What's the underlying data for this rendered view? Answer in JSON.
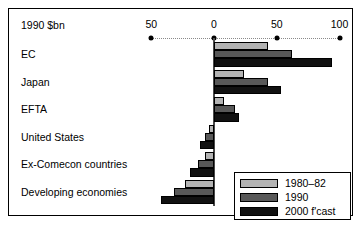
{
  "chart_data": {
    "type": "bar",
    "orientation": "horizontal",
    "title": "",
    "unit_label": "1990 $bn",
    "xlabel": "",
    "ylabel": "",
    "xlim": [
      -60,
      105
    ],
    "grid": false,
    "legend_position": "bottom-right",
    "axis_ticks": [
      {
        "label": "50",
        "value": -50
      },
      {
        "label": "0",
        "value": 0
      },
      {
        "label": "50",
        "value": 50
      },
      {
        "label": "100",
        "value": 100
      }
    ],
    "categories": [
      "EC",
      "Japan",
      "EFTA",
      "United States",
      "Ex-Comecon countries",
      "Developing economies"
    ],
    "series": [
      {
        "name": "1980–82",
        "color": "#b3b3b3",
        "values": [
          43,
          24,
          8,
          -4,
          -7,
          -23
        ]
      },
      {
        "name": "1990",
        "color": "#585858",
        "values": [
          62,
          43,
          17,
          -7,
          -13,
          -32
        ]
      },
      {
        "name": "2000 f'cast",
        "color": "#111111",
        "values": [
          94,
          53,
          20,
          -11,
          -19,
          -42
        ]
      }
    ]
  }
}
